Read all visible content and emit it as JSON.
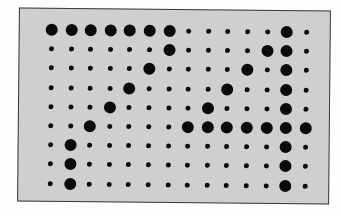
{
  "diagram": {
    "type": "dot-matrix",
    "rows": 9,
    "cols": 14,
    "colors": {
      "panel_background": "#cfcfcf",
      "panel_border": "#3a3a3a",
      "dot": "#0a0a0a",
      "page_background": "#ffffff"
    },
    "legend": {
      "1": "large dot",
      "0": "small dot"
    },
    "matrix": [
      [
        1,
        1,
        1,
        1,
        1,
        1,
        1,
        0,
        0,
        0,
        0,
        0,
        1,
        0
      ],
      [
        0,
        0,
        0,
        0,
        0,
        0,
        1,
        0,
        0,
        0,
        0,
        1,
        1,
        0
      ],
      [
        0,
        0,
        0,
        0,
        0,
        1,
        0,
        0,
        0,
        0,
        1,
        0,
        1,
        0
      ],
      [
        0,
        0,
        0,
        0,
        1,
        0,
        0,
        0,
        0,
        1,
        0,
        0,
        1,
        0
      ],
      [
        0,
        0,
        0,
        1,
        0,
        0,
        0,
        0,
        1,
        0,
        0,
        0,
        1,
        0
      ],
      [
        0,
        0,
        1,
        0,
        0,
        0,
        0,
        1,
        1,
        1,
        1,
        1,
        1,
        1
      ],
      [
        0,
        1,
        0,
        0,
        0,
        0,
        0,
        0,
        0,
        0,
        0,
        0,
        1,
        0
      ],
      [
        0,
        1,
        0,
        0,
        0,
        0,
        0,
        0,
        0,
        0,
        0,
        0,
        1,
        0
      ],
      [
        0,
        1,
        0,
        0,
        0,
        0,
        0,
        0,
        0,
        0,
        0,
        0,
        1,
        0
      ]
    ]
  }
}
